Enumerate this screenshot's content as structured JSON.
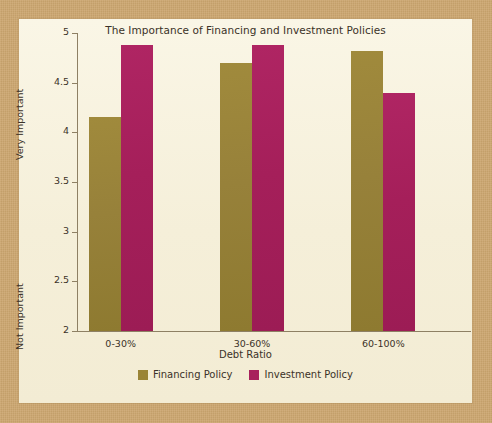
{
  "chart_data": {
    "type": "bar",
    "title": "The Importance of Financing and Investment Policies",
    "xlabel": "Debt Ratio",
    "ylabel": "",
    "categories": [
      "0-30%",
      "30-60%",
      "60-100%"
    ],
    "series": [
      {
        "name": "Financing Policy",
        "color": "#9a8436",
        "values": [
          4.15,
          4.7,
          4.82
        ]
      },
      {
        "name": "Investment Policy",
        "color": "#a8215c",
        "values": [
          4.88,
          4.88,
          4.4
        ]
      }
    ],
    "ylim": [
      2,
      5
    ],
    "ytick_labels": [
      "5",
      "4.5",
      "4",
      "3.5",
      "3",
      "2.5",
      "2"
    ],
    "ytick_values": [
      5,
      4.5,
      4,
      3.5,
      3,
      2.5,
      2
    ],
    "y_scale_high_label": "Very Important",
    "y_scale_low_label": "Not Important",
    "grid": false,
    "legend_position": "bottom"
  },
  "figure": {
    "background_color": "#cca66f",
    "panel_color": "#f7f2de"
  }
}
